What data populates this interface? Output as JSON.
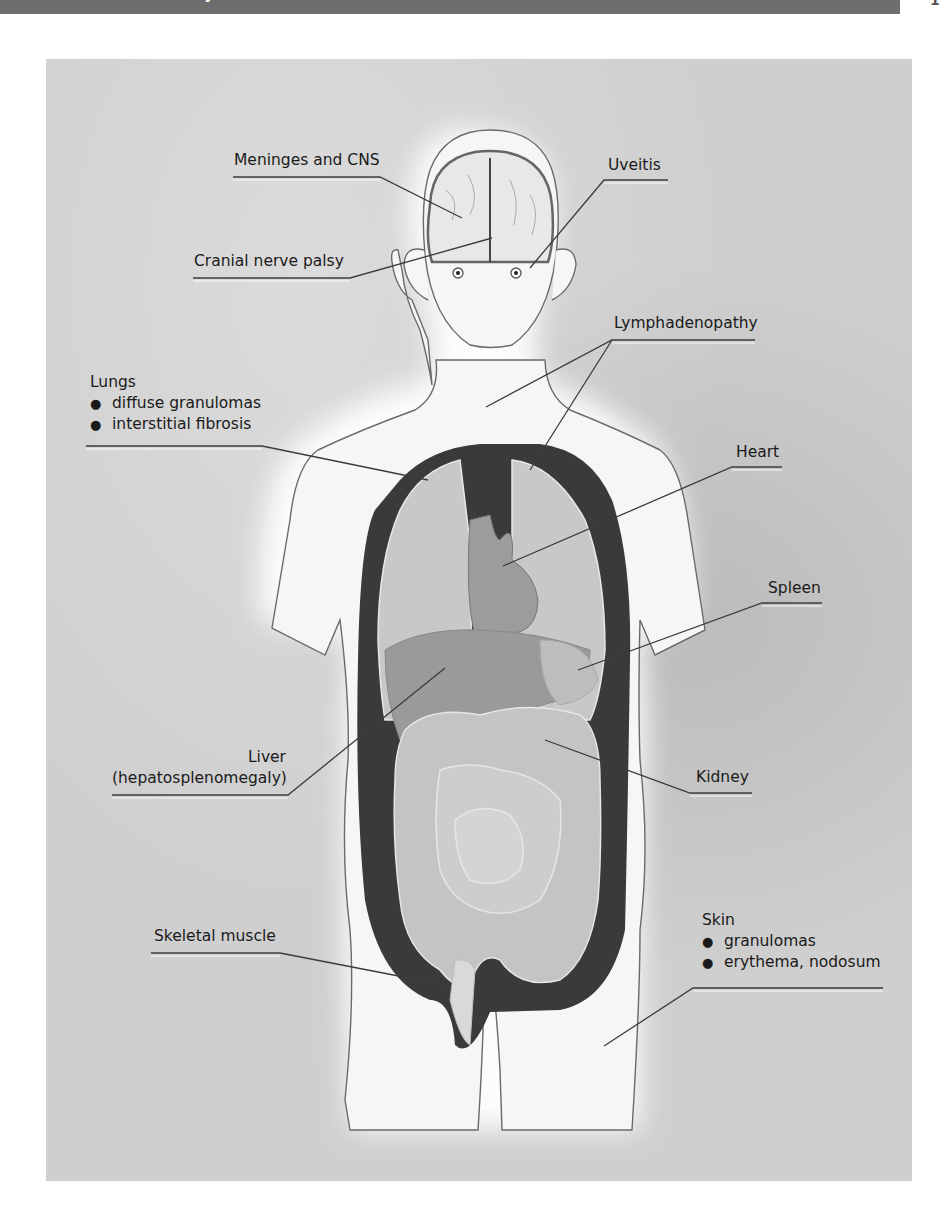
{
  "header": {
    "title": "UNIT 1 ... Multisystem Diseases",
    "page_number": "1"
  },
  "diagram": {
    "labels": {
      "meninges": "Meninges and CNS",
      "uveitis": "Uveitis",
      "cranial": "Cranial nerve palsy",
      "lymph": "Lymphadenopathy",
      "lungs": {
        "title": "Lungs",
        "bullets": [
          "diffuse granulomas",
          "interstitial fibrosis"
        ]
      },
      "heart": "Heart",
      "spleen": "Spleen",
      "liver": {
        "line1": "Liver",
        "line2": "(hepatosplenomegaly)"
      },
      "kidney": "Kidney",
      "skeletal": "Skeletal muscle",
      "skin": {
        "title": "Skin",
        "bullets": [
          "granulomas",
          "erythema, nodosum"
        ]
      }
    },
    "colors": {
      "panel_bg": "#cfcfcf",
      "body_fill": "#f4f4f4",
      "cavity": "#3a3a3a",
      "organ_light": "#c9c9c9",
      "organ_mid": "#9a9a9a",
      "outline": "#666666"
    }
  }
}
